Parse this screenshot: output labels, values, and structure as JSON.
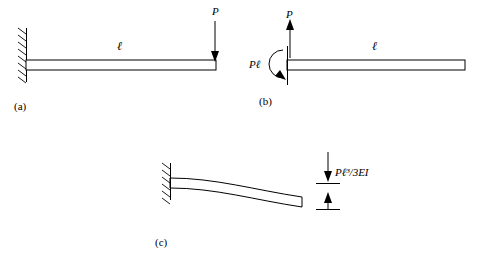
{
  "figure": {
    "panels": [
      {
        "id": "a",
        "caption": "(a)",
        "load_label": "P",
        "length_label": "ℓ",
        "description": "cantilever beam fixed at left wall with downward point load P at free right end, length ℓ"
      },
      {
        "id": "b",
        "caption": "(b)",
        "force_label": "P",
        "moment_label": "Pℓ",
        "length_label": "ℓ",
        "description": "free body of beam with upward reaction force P and reaction moment Pℓ at left end, length ℓ"
      },
      {
        "id": "c",
        "caption": "(c)",
        "deflection_label": "Pℓ³/3EI",
        "description": "deflected cantilever beam with tip deflection Pℓ³/3EI indicated by dimension arrows"
      }
    ]
  }
}
